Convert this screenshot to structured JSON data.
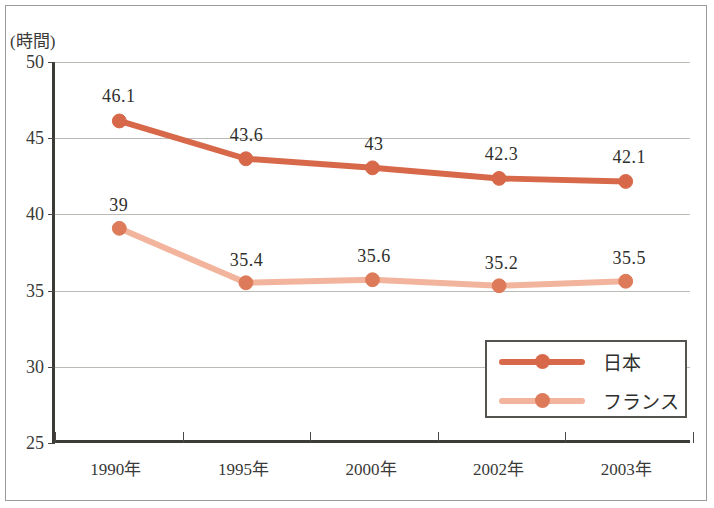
{
  "chart_data": {
    "type": "line",
    "title": "",
    "subtitle": "",
    "xlabel": "",
    "ylabel": "(時間)",
    "y_unit_label": "(時間)",
    "categories": [
      "1990年",
      "1995年",
      "2000年",
      "2002年",
      "2003年"
    ],
    "yticks": [
      50,
      45,
      40,
      35,
      30,
      25
    ],
    "ylim": [
      25,
      50
    ],
    "grid": true,
    "legend_position": "inside-bottom-right",
    "series": [
      {
        "name": "日本",
        "color": "#d7694a",
        "values": [
          46.1,
          43.6,
          43,
          42.3,
          42.1
        ],
        "labels": [
          "46.1",
          "43.6",
          "43",
          "42.3",
          "42.1"
        ]
      },
      {
        "name": "フランス",
        "color": "#f2b49c",
        "marker_color": "#dd7a59",
        "values": [
          39,
          35.4,
          35.6,
          35.2,
          35.5
        ],
        "labels": [
          "39",
          "35.4",
          "35.6",
          "35.2",
          "35.5"
        ]
      }
    ]
  },
  "colors": {
    "japan_line": "#d7694a",
    "france_line": "#f2b49c",
    "marker": "#dd7a59",
    "axis": "#3d3b38",
    "grid": "#bcbab5",
    "frame": "#9a9a96",
    "text": "#2f2f2d"
  },
  "legend": {
    "items": [
      {
        "label": "日本"
      },
      {
        "label": "フランス"
      }
    ]
  }
}
